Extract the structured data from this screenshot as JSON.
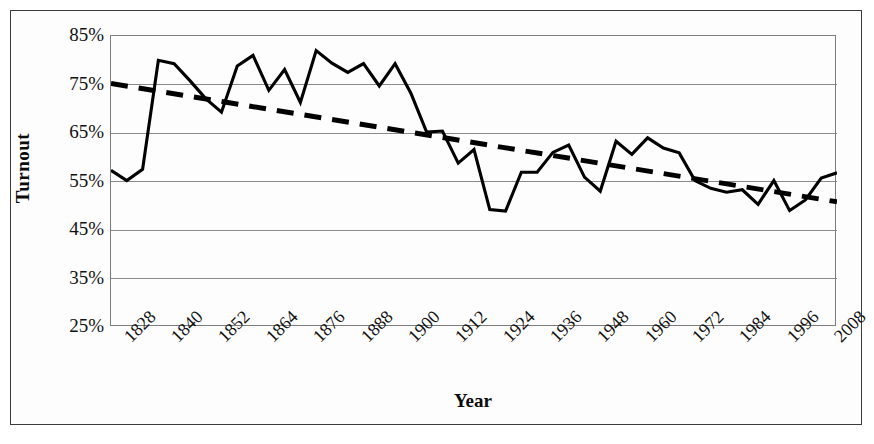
{
  "figure": {
    "background": "#ffffff",
    "frame_color": "#3b3b3b",
    "plot_border_color": "#7d7d7d",
    "gridline_color": "#8a8a8a",
    "series_color": "#000000",
    "trend_color": "#000000"
  },
  "axes": {
    "ylabel": "Turnout",
    "xlabel": "Year",
    "ytick_labels": [
      "85%",
      "75%",
      "65%",
      "55%",
      "45%",
      "35%",
      "25%"
    ],
    "xtick_labels": [
      "1828",
      "1840",
      "1852",
      "1864",
      "1876",
      "1888",
      "1900",
      "1912",
      "1924",
      "1936",
      "1948",
      "1960",
      "1972",
      "1984",
      "1996",
      "2008"
    ]
  },
  "chart_data": {
    "type": "line",
    "title": "",
    "subtitle": "",
    "xlabel": "Year",
    "ylabel": "Turnout",
    "ylim": [
      25,
      85
    ],
    "xlim": [
      1824,
      2008
    ],
    "ytick_values": [
      85,
      75,
      65,
      55,
      45,
      35,
      25
    ],
    "ytick_labels": [
      "85%",
      "75%",
      "65%",
      "55%",
      "45%",
      "35%",
      "25%"
    ],
    "xtick_values": [
      1828,
      1840,
      1852,
      1864,
      1876,
      1888,
      1900,
      1912,
      1924,
      1936,
      1948,
      1960,
      1972,
      1984,
      1996,
      2008
    ],
    "xtick_labels": [
      "1828",
      "1840",
      "1852",
      "1864",
      "1876",
      "1888",
      "1900",
      "1912",
      "1924",
      "1936",
      "1948",
      "1960",
      "1972",
      "1984",
      "1996",
      "2008"
    ],
    "grid": "horizontal",
    "legend": "none",
    "x": [
      1824,
      1828,
      1832,
      1836,
      1840,
      1844,
      1848,
      1852,
      1856,
      1860,
      1864,
      1868,
      1872,
      1876,
      1880,
      1884,
      1888,
      1892,
      1896,
      1900,
      1904,
      1908,
      1912,
      1916,
      1920,
      1924,
      1928,
      1932,
      1936,
      1940,
      1944,
      1948,
      1952,
      1956,
      1960,
      1964,
      1968,
      1972,
      1976,
      1980,
      1984,
      1988,
      1992,
      1996,
      2000,
      2004,
      2008
    ],
    "series": [
      {
        "name": "Turnout",
        "style": "solid",
        "values": [
          57.3,
          55.2,
          57.5,
          80.0,
          79.3,
          75.8,
          72.1,
          69.3,
          78.8,
          81.0,
          73.8,
          78.1,
          71.3,
          82.0,
          79.4,
          77.5,
          79.3,
          74.7,
          79.3,
          73.2,
          65.2,
          65.4,
          58.8,
          61.6,
          49.2,
          48.9,
          56.9,
          56.9,
          61.0,
          62.5,
          55.9,
          53.0,
          63.3,
          60.6,
          64.0,
          61.9,
          60.9,
          55.2,
          53.6,
          52.8,
          53.3,
          50.3,
          55.2,
          49.0,
          51.2,
          55.7,
          56.8
        ]
      },
      {
        "name": "Linear trend",
        "style": "dashed",
        "endpoints": [
          {
            "x": 1824,
            "y": 75.2
          },
          {
            "x": 2008,
            "y": 50.8
          }
        ]
      }
    ]
  }
}
